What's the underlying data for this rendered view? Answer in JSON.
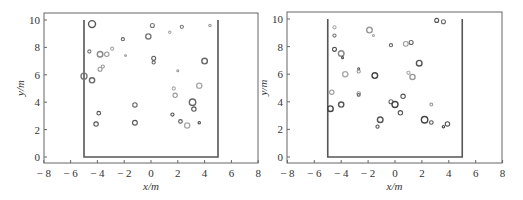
{
  "chart_data": [
    {
      "type": "scatter",
      "title": "",
      "xlabel": "x/m",
      "ylabel": "y/m",
      "xlim": [
        -8,
        8
      ],
      "ylim": [
        -0.3,
        10.3
      ],
      "xticks": [
        -8,
        -6,
        -4,
        -2,
        0,
        2,
        4,
        6,
        8
      ],
      "yticks": [
        0,
        2,
        4,
        6,
        8,
        10
      ],
      "grid": false,
      "legend": null,
      "boundary": {
        "x": [
          -5,
          -5,
          5,
          5
        ],
        "y": [
          10,
          0,
          0,
          10
        ]
      },
      "points": [
        {
          "x": -4.4,
          "y": 9.7,
          "r": 3.5,
          "c": "#555"
        },
        {
          "x": 0.1,
          "y": 9.6,
          "r": 2,
          "c": "#777"
        },
        {
          "x": 2.3,
          "y": 9.5,
          "r": 1.6,
          "c": "#777"
        },
        {
          "x": 4.4,
          "y": 9.6,
          "r": 1.2,
          "c": "#999"
        },
        {
          "x": 1.4,
          "y": 9.1,
          "r": 1.2,
          "c": "#aaa"
        },
        {
          "x": -0.2,
          "y": 8.8,
          "r": 2.6,
          "c": "#777"
        },
        {
          "x": -2.1,
          "y": 8.6,
          "r": 1.6,
          "c": "#666"
        },
        {
          "x": -4.6,
          "y": 7.7,
          "r": 1.6,
          "c": "#777"
        },
        {
          "x": -3.8,
          "y": 7.5,
          "r": 2.8,
          "c": "#888"
        },
        {
          "x": -3.3,
          "y": 7.5,
          "r": 2.2,
          "c": "#999"
        },
        {
          "x": -2.9,
          "y": 7.9,
          "r": 1.6,
          "c": "#aaa"
        },
        {
          "x": -1.9,
          "y": 7.4,
          "r": 0.9,
          "c": "#999"
        },
        {
          "x": 0.2,
          "y": 7.2,
          "r": 2,
          "c": "#666"
        },
        {
          "x": 0.2,
          "y": 6.9,
          "r": 1.6,
          "c": "#666"
        },
        {
          "x": 4.0,
          "y": 7.0,
          "r": 2.8,
          "c": "#666"
        },
        {
          "x": -3.8,
          "y": 6.4,
          "r": 2,
          "c": "#999"
        },
        {
          "x": -3.6,
          "y": 6.6,
          "r": 1.6,
          "c": "#999"
        },
        {
          "x": -5.0,
          "y": 5.9,
          "r": 3,
          "c": "#777"
        },
        {
          "x": -4.4,
          "y": 5.6,
          "r": 2.6,
          "c": "#666"
        },
        {
          "x": 2.0,
          "y": 6.3,
          "r": 1.0,
          "c": "#999"
        },
        {
          "x": 1.7,
          "y": 5.0,
          "r": 1.6,
          "c": "#aaa"
        },
        {
          "x": 3.6,
          "y": 5.2,
          "r": 2.6,
          "c": "#aaa"
        },
        {
          "x": 1.8,
          "y": 4.5,
          "r": 2.2,
          "c": "#999"
        },
        {
          "x": 3.1,
          "y": 4.0,
          "r": 3.2,
          "c": "#666"
        },
        {
          "x": 3.2,
          "y": 3.5,
          "r": 2.2,
          "c": "#555"
        },
        {
          "x": -1.2,
          "y": 3.8,
          "r": 2.2,
          "c": "#666"
        },
        {
          "x": -3.9,
          "y": 3.2,
          "r": 1.8,
          "c": "#555"
        },
        {
          "x": 1.6,
          "y": 3.1,
          "r": 1.6,
          "c": "#555"
        },
        {
          "x": -4.1,
          "y": 2.4,
          "r": 2.2,
          "c": "#555"
        },
        {
          "x": -1.2,
          "y": 2.5,
          "r": 2.4,
          "c": "#555"
        },
        {
          "x": 2.2,
          "y": 2.6,
          "r": 1.8,
          "c": "#555"
        },
        {
          "x": 2.7,
          "y": 2.3,
          "r": 2.6,
          "c": "#aaa"
        },
        {
          "x": 3.6,
          "y": 2.5,
          "r": 1.2,
          "c": "#444"
        }
      ]
    },
    {
      "type": "scatter",
      "title": "",
      "xlabel": "x/m",
      "ylabel": "y/m",
      "xlim": [
        -8,
        8
      ],
      "ylim": [
        -0.3,
        10.3
      ],
      "xticks": [
        -8,
        -6,
        -4,
        -2,
        0,
        2,
        4,
        6,
        8
      ],
      "yticks": [
        0,
        2,
        4,
        6,
        8,
        10
      ],
      "grid": false,
      "legend": null,
      "boundary": {
        "x": [
          -5,
          -5,
          5,
          5
        ],
        "y": [
          10,
          0,
          0,
          10
        ]
      },
      "points": [
        {
          "x": 3.1,
          "y": 9.9,
          "r": 2.0,
          "c": "#555"
        },
        {
          "x": 3.6,
          "y": 9.8,
          "r": 2.0,
          "c": "#666"
        },
        {
          "x": -4.5,
          "y": 9.4,
          "r": 1.6,
          "c": "#aaa"
        },
        {
          "x": -1.9,
          "y": 9.2,
          "r": 2.8,
          "c": "#999"
        },
        {
          "x": -1.6,
          "y": 8.8,
          "r": 1.0,
          "c": "#aaa"
        },
        {
          "x": -4.5,
          "y": 8.8,
          "r": 1.6,
          "c": "#777"
        },
        {
          "x": -0.3,
          "y": 8.1,
          "r": 1.6,
          "c": "#666"
        },
        {
          "x": 0.8,
          "y": 8.2,
          "r": 2.4,
          "c": "#999"
        },
        {
          "x": 1.2,
          "y": 8.3,
          "r": 2.0,
          "c": "#666"
        },
        {
          "x": -4.5,
          "y": 7.8,
          "r": 2.0,
          "c": "#555"
        },
        {
          "x": -4.0,
          "y": 7.5,
          "r": 2.8,
          "c": "#888"
        },
        {
          "x": -3.9,
          "y": 7.2,
          "r": 1.0,
          "c": "#555"
        },
        {
          "x": 1.8,
          "y": 6.8,
          "r": 2.8,
          "c": "#555"
        },
        {
          "x": -2.7,
          "y": 6.4,
          "r": 1.0,
          "c": "#555"
        },
        {
          "x": -2.7,
          "y": 6.2,
          "r": 1.6,
          "c": "#999"
        },
        {
          "x": -3.7,
          "y": 6.0,
          "r": 2.6,
          "c": "#aaa"
        },
        {
          "x": -1.5,
          "y": 5.9,
          "r": 2.8,
          "c": "#444"
        },
        {
          "x": 1.0,
          "y": 6.1,
          "r": 1.6,
          "c": "#aaa"
        },
        {
          "x": 1.3,
          "y": 5.8,
          "r": 2.6,
          "c": "#999"
        },
        {
          "x": -4.7,
          "y": 4.7,
          "r": 2.2,
          "c": "#999"
        },
        {
          "x": -2.7,
          "y": 4.6,
          "r": 1.8,
          "c": "#999"
        },
        {
          "x": -2.7,
          "y": 4.5,
          "r": 1.4,
          "c": "#666"
        },
        {
          "x": 0.6,
          "y": 4.4,
          "r": 2.2,
          "c": "#555"
        },
        {
          "x": -4.8,
          "y": 3.5,
          "r": 2.8,
          "c": "#444"
        },
        {
          "x": -4.0,
          "y": 3.8,
          "r": 2.6,
          "c": "#555"
        },
        {
          "x": -0.3,
          "y": 4.0,
          "r": 2.0,
          "c": "#666"
        },
        {
          "x": 0.0,
          "y": 3.8,
          "r": 3.0,
          "c": "#444"
        },
        {
          "x": 2.7,
          "y": 3.8,
          "r": 1.4,
          "c": "#999"
        },
        {
          "x": 0.4,
          "y": 3.2,
          "r": 2.2,
          "c": "#555"
        },
        {
          "x": -1.1,
          "y": 2.7,
          "r": 2.8,
          "c": "#555"
        },
        {
          "x": -1.3,
          "y": 2.2,
          "r": 1.6,
          "c": "#555"
        },
        {
          "x": 2.2,
          "y": 2.7,
          "r": 3.2,
          "c": "#444"
        },
        {
          "x": 2.7,
          "y": 2.5,
          "r": 1.8,
          "c": "#555"
        },
        {
          "x": 3.6,
          "y": 2.2,
          "r": 1.2,
          "c": "#444"
        },
        {
          "x": 3.9,
          "y": 2.4,
          "r": 2.2,
          "c": "#555"
        }
      ]
    }
  ],
  "layout": {
    "panels": [
      {
        "frame": {
          "left": 44,
          "right": 258,
          "top": 13,
          "bottom": 163
        },
        "x0px": 151,
        "xscale": 13.4,
        "y0px": 157,
        "yscale": 13.7
      },
      {
        "frame": {
          "left": 25,
          "right": 240,
          "top": 12,
          "bottom": 163
        },
        "x0px": 133,
        "xscale": 13.45,
        "y0px": 157,
        "yscale": 13.8
      }
    ]
  }
}
